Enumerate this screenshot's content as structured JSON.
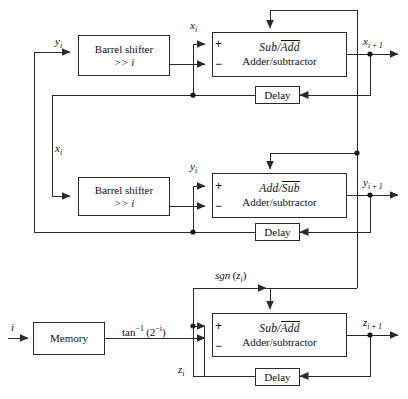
{
  "diagram": {
    "background_color": "#ffffff",
    "line_color": "#2a2a2a",
    "text_color": "#111111"
  },
  "stages": [
    {
      "id": "x-stage",
      "shifter": {
        "line1": "Barrel shifter",
        "line2": ">> i"
      },
      "adder": {
        "op_left": "Sub",
        "op_sep": "/",
        "op_right_overlined": "Add",
        "subtitle": "Adder/subtractor",
        "plus": "+",
        "minus": "−"
      },
      "delay": {
        "label": "Delay"
      },
      "input_label": "y",
      "input_sub": "i",
      "feedback_label": "x",
      "feedback_sub": "i",
      "output_label": "x",
      "output_sub": "i + 1"
    },
    {
      "id": "y-stage",
      "shifter": {
        "line1": "Barrel shifter",
        "line2": ">> i"
      },
      "adder": {
        "op_left": "Add",
        "op_sep": "/",
        "op_right_overlined": "Sub",
        "subtitle": "Adder/subtractor",
        "plus": "+",
        "minus": "−"
      },
      "delay": {
        "label": "Delay"
      },
      "input_label": "x",
      "input_sub": "i",
      "feedback_label": "y",
      "feedback_sub": "i",
      "output_label": "y",
      "output_sub": "i + 1"
    },
    {
      "id": "z-stage",
      "memory": {
        "label": "Memory"
      },
      "adder": {
        "op_left": "Sub",
        "op_sep": "/",
        "op_right_overlined": "Add",
        "subtitle": "Adder/subtractor",
        "plus": "+",
        "minus": "−"
      },
      "delay": {
        "label": "Delay"
      },
      "index_input": "i",
      "rom_output_fn": "tan",
      "rom_output_exp": "−1",
      "rom_output_arg_base": "(2",
      "rom_output_arg_exp": "−i",
      "rom_output_arg_close": ")",
      "sign_fn": "sgn",
      "sign_arg_open": "(",
      "sign_arg": "z",
      "sign_arg_sub": "i",
      "sign_arg_close": ")",
      "feedback_label": "z",
      "feedback_sub": "i",
      "output_label": "z",
      "output_sub": "i + 1"
    }
  ]
}
